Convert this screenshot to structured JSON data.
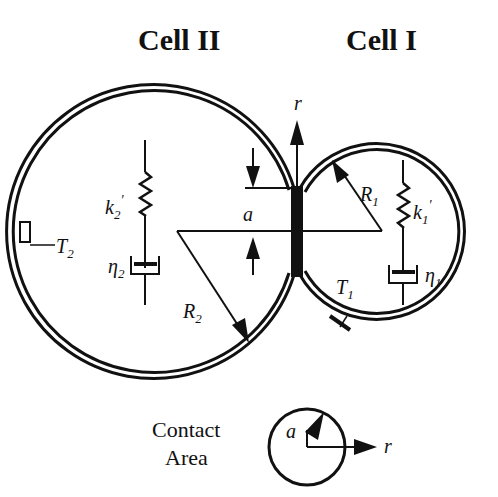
{
  "titles": {
    "cell_2": "Cell II",
    "cell_1": "Cell I"
  },
  "cell_2": {
    "spring_label": "k",
    "spring_sub": "2",
    "spring_prime": "'",
    "dashpot_label": "η",
    "dashpot_sub": "2",
    "tension_label": "T",
    "tension_sub": "2",
    "radius_label": "R",
    "radius_sub": "2"
  },
  "cell_1": {
    "spring_label": "k",
    "spring_sub": "1",
    "spring_prime": "'",
    "dashpot_label": "η",
    "dashpot_sub": "1",
    "tension_label": "T",
    "tension_sub": "1",
    "radius_label": "R",
    "radius_sub": "1"
  },
  "contact": {
    "axis_label": "r",
    "radius_label": "a"
  },
  "contact_area": {
    "line1": "Contact",
    "line2": "Area",
    "radius_label": "a",
    "axis_label": "r"
  },
  "colors": {
    "ink": "#111111",
    "background": "#ffffff"
  }
}
